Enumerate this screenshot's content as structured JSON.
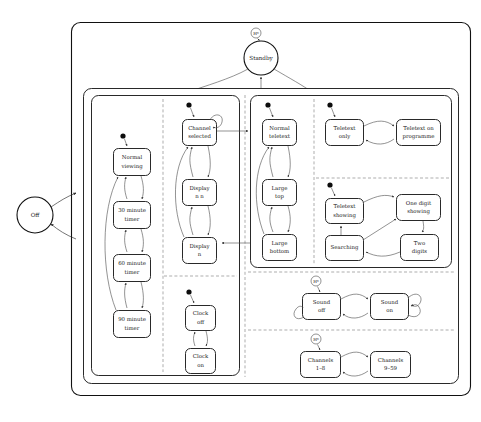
{
  "diagram": {
    "notation": "UML statechart",
    "colors": {
      "background": "#ffffff",
      "stroke": "#111111",
      "edge": "#4a4a4a",
      "divider": "#8a8a8a",
      "initial_dot": "#0d0d0d",
      "text": "#1a1a1a"
    }
  },
  "states": {
    "off": {
      "label": "Off",
      "shape": "circle"
    },
    "standby": {
      "label": "Standby",
      "shape": "circle"
    },
    "timer_region": [
      {
        "label_line1": "Normal",
        "label_line2": "viewing"
      },
      {
        "label_line1": "30 minute",
        "label_line2": "timer"
      },
      {
        "label_line1": "60 minute",
        "label_line2": "timer"
      },
      {
        "label_line1": "90 minute",
        "label_line2": "timer"
      }
    ],
    "channel_region": [
      {
        "label_line1": "Channel",
        "label_line2": "selected"
      },
      {
        "label_line1": "Display",
        "label_line2": "n n"
      },
      {
        "label_line1": "Display",
        "label_line2": "n"
      }
    ],
    "clock_region": [
      {
        "label_line1": "Clock",
        "label_line2": "off"
      },
      {
        "label_line1": "Clock",
        "label_line2": "on"
      }
    ],
    "picture_region": [
      {
        "label_line1": "Normal",
        "label_line2": "teletext"
      },
      {
        "label_line1": "Large",
        "label_line2": "top"
      },
      {
        "label_line1": "Large",
        "label_line2": "bottom"
      }
    ],
    "teletext_mode_region": [
      {
        "label_line1": "Teletext",
        "label_line2": "only"
      },
      {
        "label_line1": "Teletext on",
        "label_line2": "programme"
      }
    ],
    "teletext_search_region": [
      {
        "label_line1": "Teletext",
        "label_line2": "showing"
      },
      {
        "label_line1": "One digit",
        "label_line2": "showing"
      },
      {
        "label_line1": "Searching",
        "label_line2": ""
      },
      {
        "label_line1": "Two",
        "label_line2": "digits"
      }
    ],
    "sound_region": [
      {
        "label_line1": "Sound",
        "label_line2": "off"
      },
      {
        "label_line1": "Sound",
        "label_line2": "on"
      }
    ],
    "channels_region": [
      {
        "label_line1": "Channels",
        "label_line2": "1–8"
      },
      {
        "label_line1": "Channels",
        "label_line2": "9–59"
      }
    ]
  },
  "history_markers": [
    {
      "label": "H*",
      "target": "standby"
    },
    {
      "label": "H*",
      "target": "sound-off"
    },
    {
      "label": "H*",
      "target": "channels-1-8"
    }
  ]
}
